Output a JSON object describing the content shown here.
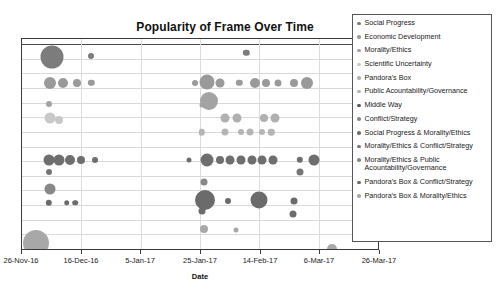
{
  "chart_data": {
    "type": "scatter",
    "title": "Popularity of Frame Over Time",
    "xlabel": "Date",
    "ylabel": "",
    "grid": true,
    "legend_position": "right",
    "xticks": [
      "26-Nov-16",
      "16-Dec-16",
      "5-Jan-17",
      "25-Jan-17",
      "14-Feb-17",
      "6-Mar-17",
      "26-Mar-17"
    ],
    "xlim": [
      "26-Nov-16",
      "26-Mar-17"
    ],
    "series": [
      {
        "name": "Social Progress",
        "color": "#7c7c7c",
        "points": [
          {
            "x": 8.5,
            "y": 8.5,
            "r": 11.5
          },
          {
            "x": 19.5,
            "y": 8.0,
            "r": 3.0
          },
          {
            "x": 63.0,
            "y": 6.5,
            "r": 3.2
          }
        ]
      },
      {
        "name": "Economic Development",
        "color": "#9a9a9a",
        "points": [
          {
            "x": 8.0,
            "y": 21.0,
            "r": 6.0
          },
          {
            "x": 11.5,
            "y": 21.0,
            "r": 5.0
          },
          {
            "x": 15.5,
            "y": 21.0,
            "r": 4.0
          },
          {
            "x": 19.5,
            "y": 21.0,
            "r": 3.2
          },
          {
            "x": 48.5,
            "y": 21.0,
            "r": 3.0
          },
          {
            "x": 52.0,
            "y": 20.5,
            "r": 7.5
          },
          {
            "x": 55.5,
            "y": 21.0,
            "r": 4.5
          },
          {
            "x": 61.0,
            "y": 21.0,
            "r": 3.2
          },
          {
            "x": 65.5,
            "y": 21.0,
            "r": 5.0
          },
          {
            "x": 68.5,
            "y": 21.0,
            "r": 4.0
          },
          {
            "x": 72.0,
            "y": 21.0,
            "r": 3.5
          },
          {
            "x": 76.5,
            "y": 21.0,
            "r": 4.0
          },
          {
            "x": 80.0,
            "y": 21.0,
            "r": 6.0
          }
        ]
      },
      {
        "name": "Morality/Ethics",
        "color": "#a3a3a3",
        "points": [
          {
            "x": 7.5,
            "y": 31.0,
            "r": 3.0
          },
          {
            "x": 52.5,
            "y": 29.5,
            "r": 9.0
          },
          {
            "x": 50.5,
            "y": 31.5,
            "r": 2.5
          }
        ]
      },
      {
        "name": "Scientific Uncertainty",
        "color": "#c8c8c8",
        "points": [
          {
            "x": 8.0,
            "y": 37.5,
            "r": 5.5
          },
          {
            "x": 10.5,
            "y": 38.5,
            "r": 4.0
          }
        ]
      },
      {
        "name": "Pandora's Box",
        "color": "#b0b0b0",
        "points": [
          {
            "x": 57.0,
            "y": 37.5,
            "r": 4.5
          },
          {
            "x": 60.5,
            "y": 37.5,
            "r": 4.5
          },
          {
            "x": 68.0,
            "y": 37.5,
            "r": 4.0
          },
          {
            "x": 71.0,
            "y": 37.5,
            "r": 4.5
          }
        ]
      },
      {
        "name": "Public Acountability/Governance",
        "color": "#b5b5b5",
        "points": [
          {
            "x": 50.5,
            "y": 44.5,
            "r": 3.2
          },
          {
            "x": 57.0,
            "y": 44.5,
            "r": 3.5
          },
          {
            "x": 61.5,
            "y": 44.5,
            "r": 3.0
          },
          {
            "x": 64.0,
            "y": 44.5,
            "r": 3.5
          },
          {
            "x": 67.5,
            "y": 44.5,
            "r": 3.0
          },
          {
            "x": 70.0,
            "y": 44.5,
            "r": 3.2
          }
        ]
      },
      {
        "name": "Middle Way",
        "color": "#5a5a5a",
        "points": []
      },
      {
        "name": "Conflict/Strategy",
        "color": "#8a8a8a",
        "points": []
      },
      {
        "name": "Social Progress & Morality/Ethics",
        "color": "#6e6e6e",
        "points": [
          {
            "x": 7.5,
            "y": 57.5,
            "r": 5.5
          },
          {
            "x": 10.5,
            "y": 57.5,
            "r": 5.5
          },
          {
            "x": 13.5,
            "y": 57.5,
            "r": 5.0
          },
          {
            "x": 16.5,
            "y": 57.5,
            "r": 4.0
          },
          {
            "x": 20.5,
            "y": 57.5,
            "r": 3.0
          },
          {
            "x": 47.0,
            "y": 57.5,
            "r": 2.5
          },
          {
            "x": 52.0,
            "y": 57.5,
            "r": 6.5
          },
          {
            "x": 55.5,
            "y": 57.5,
            "r": 4.0
          },
          {
            "x": 58.5,
            "y": 57.5,
            "r": 4.5
          },
          {
            "x": 61.5,
            "y": 57.5,
            "r": 4.5
          },
          {
            "x": 64.5,
            "y": 57.5,
            "r": 4.5
          },
          {
            "x": 67.5,
            "y": 57.5,
            "r": 4.5
          },
          {
            "x": 70.5,
            "y": 57.5,
            "r": 4.5
          },
          {
            "x": 78.0,
            "y": 57.5,
            "r": 3.2
          },
          {
            "x": 82.0,
            "y": 57.5,
            "r": 5.5
          }
        ]
      },
      {
        "name": "Morality/Ethics & Conflict/Strategy",
        "color": "#767676",
        "points": [
          {
            "x": 7.5,
            "y": 63.5,
            "r": 3.0
          },
          {
            "x": 78.0,
            "y": 63.5,
            "r": 3.5
          }
        ]
      },
      {
        "name": "Morality/Ethics & Public Acountability/Governance",
        "color": "#888888",
        "points": [
          {
            "x": 8.0,
            "y": 71.5,
            "r": 5.5
          },
          {
            "x": 51.0,
            "y": 68.0,
            "r": 3.5
          }
        ]
      },
      {
        "name": "Pandora's Box & Conflict/Strategy",
        "color": "#6b6b6b",
        "points": [
          {
            "x": 7.5,
            "y": 78.0,
            "r": 3.2
          },
          {
            "x": 12.5,
            "y": 78.0,
            "r": 2.8
          },
          {
            "x": 15.0,
            "y": 78.0,
            "r": 2.8
          },
          {
            "x": 51.5,
            "y": 76.5,
            "r": 10.0
          },
          {
            "x": 50.5,
            "y": 82.0,
            "r": 3.5
          },
          {
            "x": 58.0,
            "y": 77.0,
            "r": 3.0
          },
          {
            "x": 66.5,
            "y": 76.5,
            "r": 8.5
          },
          {
            "x": 76.5,
            "y": 77.0,
            "r": 3.5
          },
          {
            "x": 76.0,
            "y": 83.5,
            "r": 3.5
          }
        ]
      },
      {
        "name": "Pandora's Box & Morality/Ethics",
        "color": "#a8a8a8",
        "points": [
          {
            "x": 4.0,
            "y": 97.0,
            "r": 13.0
          },
          {
            "x": 51.0,
            "y": 90.5,
            "r": 4.0
          },
          {
            "x": 60.0,
            "y": 91.0,
            "r": 2.5
          },
          {
            "x": 87.0,
            "y": 100.0,
            "r": 5.0
          }
        ]
      }
    ]
  },
  "legend": {
    "items": [
      {
        "label": "Social Progress",
        "color": "#7c7c7c"
      },
      {
        "label": "Economic Development",
        "color": "#9a9a9a"
      },
      {
        "label": "Morality/Ethics",
        "color": "#a3a3a3"
      },
      {
        "label": "Scientific Uncertainty",
        "color": "#c8c8c8"
      },
      {
        "label": "Pandora's Box",
        "color": "#b0b0b0"
      },
      {
        "label": "Public Acountability/Governance",
        "color": "#b5b5b5"
      },
      {
        "label": "Middle Way",
        "color": "#5a5a5a"
      },
      {
        "label": "Conflict/Strategy",
        "color": "#8a8a8a"
      },
      {
        "label": "Social Progress & Morality/Ethics",
        "color": "#6e6e6e"
      },
      {
        "label": "Morality/Ethics & Conflict/Strategy",
        "color": "#767676"
      },
      {
        "label": "Morality/Ethics & Public\nAcountability/Governance",
        "color": "#888888"
      },
      {
        "label": "Pandora's Box & Conflict/Strategy",
        "color": "#6b6b6b"
      },
      {
        "label": "Pandora's Box & Morality/Ethics",
        "color": "#a8a8a8"
      }
    ]
  },
  "axes": {
    "x_title": "Date",
    "x_tick_labels": [
      "26-Nov-16",
      "16-Dec-16",
      "5-Jan-17",
      "25-Jan-17",
      "14-Feb-17",
      "6-Mar-17",
      "26-Mar-17"
    ]
  },
  "style": {
    "grid_color": "#d9d9d9",
    "frame_color": "#3a3a3a",
    "background": "#ffffff"
  }
}
